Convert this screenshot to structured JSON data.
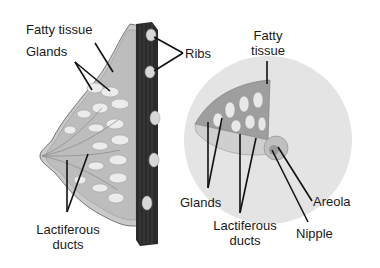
{
  "diagram": {
    "left_view": {
      "labels": {
        "fatty_tissue": "Fatty tissue",
        "glands": "Glands",
        "ribs": "Ribs",
        "lactiferous_ducts_line1": "Lactiferous",
        "lactiferous_ducts_line2": "ducts"
      }
    },
    "right_view": {
      "labels": {
        "fatty_line1": "Fatty",
        "fatty_line2": "tissue",
        "glands": "Glands",
        "lactiferous_ducts_line1": "Lactiferous",
        "lactiferous_ducts_line2": "ducts",
        "areola": "Areola",
        "nipple": "Nipple"
      }
    },
    "colors": {
      "background": "#ffffff",
      "text": "#1a1a1a",
      "rib_muscle": "#2b2b2b",
      "tissue": "#b8b8b8",
      "gland": "#e6e6e6",
      "disc": "#e2e2e2"
    }
  }
}
